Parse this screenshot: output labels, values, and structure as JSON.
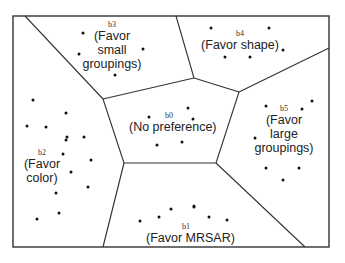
{
  "diagram": {
    "type": "voronoi-partition",
    "frame": {
      "x": 13,
      "y": 16,
      "width": 316,
      "height": 231
    },
    "edges": [
      [
        25,
        16,
        103,
        99
      ],
      [
        103,
        99,
        194,
        78
      ],
      [
        194,
        78,
        176,
        16
      ],
      [
        194,
        78,
        239,
        92
      ],
      [
        239,
        92,
        329,
        48
      ],
      [
        239,
        92,
        216,
        163
      ],
      [
        216,
        163,
        124,
        163
      ],
      [
        124,
        163,
        103,
        99
      ],
      [
        124,
        163,
        103,
        247
      ],
      [
        216,
        163,
        305,
        247
      ]
    ],
    "regions": [
      {
        "id": "b0",
        "lines": [
          "(No preference)"
        ],
        "label_pos": {
          "x": 169,
          "y": 114
        },
        "points": [
          [
            149,
            117
          ],
          [
            188,
            108
          ],
          [
            193,
            119
          ],
          [
            157,
            145
          ],
          [
            182,
            142
          ]
        ]
      },
      {
        "id": "b1",
        "lines": [
          "(Favor MRSAR)"
        ],
        "label_pos": {
          "x": 186,
          "y": 225
        },
        "points": [
          [
            140,
            221
          ],
          [
            159,
            217
          ],
          [
            171,
            209
          ],
          [
            194,
            206
          ],
          [
            209,
            217
          ],
          [
            227,
            220
          ],
          [
            194,
            207
          ]
        ]
      },
      {
        "id": "b2",
        "lines": [
          "(Favor",
          "color)"
        ],
        "label_pos": {
          "x": 41,
          "y": 150
        },
        "points": [
          [
            33,
            100
          ],
          [
            66,
            113
          ],
          [
            27,
            126
          ],
          [
            46,
            127
          ],
          [
            66,
            140
          ],
          [
            84,
            137
          ],
          [
            63,
            154
          ],
          [
            91,
            160
          ],
          [
            71,
            172
          ],
          [
            88,
            187
          ],
          [
            56,
            193
          ],
          [
            59,
            213
          ],
          [
            37,
            219
          ],
          [
            67,
            137
          ]
        ]
      },
      {
        "id": "b3",
        "lines": [
          "(Favor",
          "small",
          "groupings)"
        ],
        "label_pos": {
          "x": 112,
          "y": 22
        },
        "points": [
          [
            83,
            33
          ],
          [
            79,
            54
          ],
          [
            143,
            49
          ],
          [
            115,
            75
          ]
        ]
      },
      {
        "id": "b4",
        "lines": [
          "(Favor shape)"
        ],
        "label_pos": {
          "x": 240,
          "y": 32
        },
        "points": [
          [
            211,
            28
          ],
          [
            269,
            28
          ],
          [
            283,
            50
          ],
          [
            225,
            57
          ],
          [
            250,
            57
          ]
        ]
      },
      {
        "id": "b5",
        "lines": [
          "(Favor",
          "large",
          "groupings)"
        ],
        "label_pos": {
          "x": 284,
          "y": 108
        },
        "points": [
          [
            266,
            106
          ],
          [
            302,
            109
          ],
          [
            312,
            101
          ],
          [
            255,
            138
          ],
          [
            266,
            168
          ],
          [
            299,
            168
          ],
          [
            283,
            180
          ]
        ]
      }
    ]
  }
}
